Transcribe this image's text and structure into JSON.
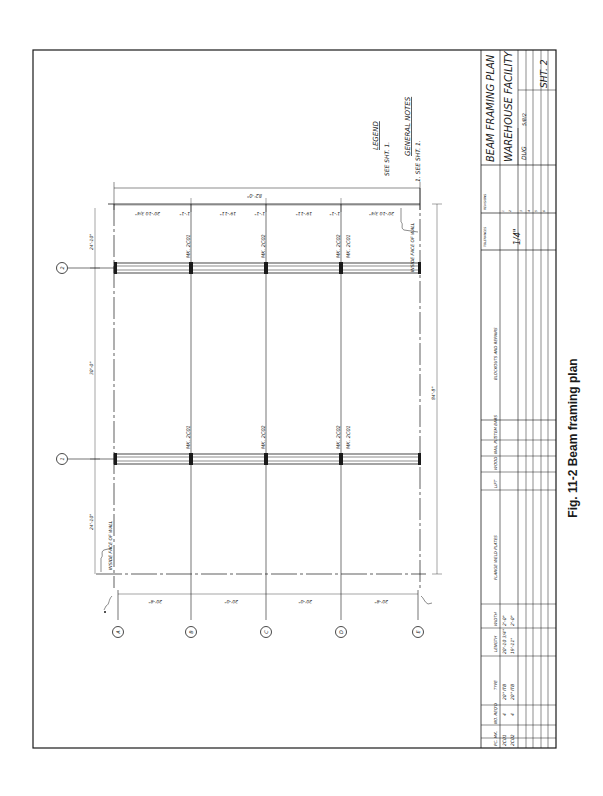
{
  "drawing": {
    "title": "BEAM FRAMING PLAN",
    "subtitle": "WAREHOUSE FACILITY",
    "sheet": "SHT. 2",
    "scale": "1/4\"",
    "drawn_by": "DUG",
    "date": "5/8/2",
    "legend_heading": "LEGEND",
    "legend_text": "SEE SHT. 1.",
    "notes_heading": "GENERAL NOTES",
    "notes_text": "1. SEE SHT. 1.",
    "column_lines": [
      "A",
      "B",
      "C",
      "D",
      "E"
    ],
    "row_lines": [
      "1",
      "2"
    ],
    "dims_bottom": [
      "20'-8\"",
      "20'-0\"",
      "20'-0\"",
      "20'-8\""
    ],
    "dims_top_overall": "82'-0\"",
    "dims_top": [
      "20'-10 3/4\"",
      "1'-1\"",
      "19'-11\"",
      "1'-1\"",
      "19'-11\"",
      "1'-1\"",
      "20'-10 3/4\""
    ],
    "dims_left": [
      "24'-10\"",
      "30'-0\"",
      "24'-10\""
    ],
    "dims_right_overall": "84'-8\"",
    "wall_note": "INSIDE FACE OF WALL",
    "beam_marks_row2": [
      "MK. 2C01",
      "MK. 2C02",
      "MK. 2C02",
      "MK. 2C01"
    ],
    "beam_marks_row1": [
      "MK. 2C01",
      "MK. 2C02",
      "MK. 2C02",
      "MK. 2C01"
    ],
    "tolerances_label": "TOLERANCES",
    "revisions_label": "REVISIONS",
    "revision_cols": [
      "NO.",
      "DATE",
      "BY"
    ],
    "revision_numbers": [
      "1",
      "2",
      "3",
      "4",
      "5",
      "6"
    ]
  },
  "schedule": {
    "headers": [
      "PC. MK.",
      "NO. REQ'D",
      "TYPE",
      "LENGTH",
      "WIDTH",
      "FLANGE WELD PLATES",
      "LIFT",
      "WOOD",
      "NAIL PLT",
      "STEM BARS",
      "BLOCKOUTS AND REPAIRS"
    ],
    "rows": [
      [
        "2C01",
        "4",
        "20\" ITB",
        "20'-10 3/4\"",
        "2'-0\""
      ],
      [
        "2C02",
        "4",
        "20\" ITB",
        "19'-11\"",
        "2'-0\""
      ]
    ]
  },
  "figure_caption": "Fig. 11-2  Beam framing plan"
}
